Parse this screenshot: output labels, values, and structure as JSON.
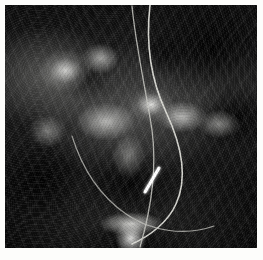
{
  "figure": {
    "kind": "radiograph",
    "modality": "X-ray",
    "region": "pelvis / lower abdomen",
    "caption": "",
    "width_px": 263,
    "height_px": 260,
    "border": {
      "color": "#fdfdfb",
      "left_px": 5,
      "top_px": 5,
      "right_px": 6,
      "bottom_px": 12
    },
    "plate": {
      "left_px": 5,
      "top_px": 5,
      "width_px": 252,
      "height_px": 243,
      "background_color": "#050505"
    }
  },
  "palette": {
    "film_black": "#050505",
    "film_deep_shadow": "#0b0b0b",
    "film_midtone": "#6e6e6c",
    "bone_bright": "#e8e8e4",
    "marker_white": "#ffffff",
    "paper_white": "#fdfdfb"
  },
  "annotations": [
    {
      "id": "arrow-marker",
      "name": "arrow-marker",
      "type": "arrow",
      "color": "#ffffff",
      "label": "",
      "direction": "up-right",
      "x1_px": 145,
      "y1_px": 192,
      "x2_px": 159,
      "y2_px": 168,
      "stroke_width_px": 3
    }
  ],
  "devices": [
    {
      "id": "catheter-primary",
      "name": "catheter-line",
      "type": "radio-opaque-catheter",
      "color": "#dcdcd6",
      "stroke_width_px": 1.6,
      "path": "M 150 5 C 146 40, 150 78, 166 112 C 182 146, 188 178, 176 204 C 168 222, 150 236, 132 244"
    },
    {
      "id": "catheter-secondary",
      "name": "catheter-line-secondary",
      "type": "radio-opaque-catheter",
      "color": "#c8c8c2",
      "stroke_width_px": 1.3,
      "path": "M 132 6 C 136 48, 146 90, 152 130 C 157 168, 152 206, 140 247"
    },
    {
      "id": "catheter-tail",
      "name": "catheter-tail",
      "type": "radio-opaque-catheter",
      "color": "#bdbdb8",
      "stroke_width_px": 1.2,
      "path": "M 72 136 C 82 168, 100 196, 126 214 C 152 232, 186 236, 214 226"
    }
  ],
  "anatomy_features": [
    {
      "id": "iliac-wing-left",
      "name": "iliac-wing-left",
      "cx_px": 68,
      "cy_px": 74,
      "brightness": "high"
    },
    {
      "id": "iliac-wing-right",
      "name": "iliac-wing-right",
      "cx_px": 196,
      "cy_px": 120,
      "brightness": "medium"
    },
    {
      "id": "sacroiliac-joint",
      "name": "sacroiliac-joint",
      "cx_px": 152,
      "cy_px": 105,
      "brightness": "high"
    },
    {
      "id": "lumbar-vertebra",
      "name": "lumbar-vertebra",
      "cx_px": 108,
      "cy_px": 122,
      "brightness": "high"
    },
    {
      "id": "sacrum",
      "name": "sacrum",
      "cx_px": 131,
      "cy_px": 224,
      "brightness": "very-high"
    },
    {
      "id": "bowel-gas-shadow",
      "name": "bowel-gas-shadow",
      "cx_px": 212,
      "cy_px": 48,
      "brightness": "very-low"
    }
  ]
}
